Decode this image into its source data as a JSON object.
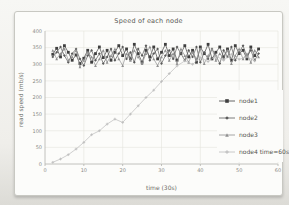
{
  "window": {
    "width": 289,
    "height": 205,
    "kind": "photographed-chart"
  },
  "colors": {
    "page_bg": "#efeeea",
    "card_bg": "#fcfcfa",
    "card_border": "#c8c8c2",
    "grid": "#e4e4de",
    "axis": "#b3b3ad",
    "text": "#5a5a55",
    "node1": "#3f3f3f",
    "node2": "#5a5a5a",
    "node3": "#909090",
    "node4": "#bcbcbc"
  },
  "chart_data": {
    "type": "line",
    "title": "Speed of each node",
    "xlabel": "time (30s)",
    "ylabel": "read speed (mb/s)",
    "xlim": [
      0,
      60
    ],
    "ylim": [
      0,
      400
    ],
    "xticks": [
      0,
      10,
      20,
      30,
      40,
      50,
      60
    ],
    "yticks": [
      0,
      50,
      100,
      150,
      200,
      250,
      300,
      350,
      400
    ],
    "grid": true,
    "legend_position": "right-inside",
    "series": [
      {
        "name": "node1",
        "color": "#3f3f3f",
        "marker": "square",
        "x": [
          2,
          3,
          4,
          5,
          6,
          7,
          8,
          9,
          10,
          11,
          12,
          13,
          14,
          15,
          16,
          17,
          18,
          19,
          20,
          21,
          22,
          23,
          24,
          25,
          26,
          27,
          28,
          29,
          30,
          31,
          32,
          33,
          34,
          35,
          36,
          37,
          38,
          39,
          40,
          41,
          42,
          43,
          44,
          45,
          46,
          47,
          48,
          49,
          50,
          51,
          52,
          53,
          54,
          55
        ],
        "y": [
          330,
          348,
          322,
          356,
          336,
          312,
          328,
          302,
          318,
          342,
          306,
          332,
          352,
          320,
          342,
          312,
          336,
          356,
          326,
          346,
          316,
          360,
          332,
          306,
          342,
          322,
          352,
          316,
          336,
          360,
          326,
          346,
          312,
          332,
          356,
          322,
          342,
          306,
          352,
          332,
          360,
          316,
          336,
          352,
          322,
          346,
          312,
          356,
          332,
          342,
          316,
          352,
          326,
          346
        ]
      },
      {
        "name": "node2",
        "color": "#5a5a5a",
        "marker": "diamond",
        "x": [
          2,
          3,
          4,
          5,
          6,
          7,
          8,
          9,
          10,
          11,
          12,
          13,
          14,
          15,
          16,
          17,
          18,
          19,
          20,
          21,
          22,
          23,
          24,
          25,
          26,
          27,
          28,
          29,
          30,
          31,
          32,
          33,
          34,
          35,
          36,
          37,
          38,
          39,
          40,
          41,
          42,
          43,
          44,
          45,
          46,
          47,
          48,
          49,
          50,
          51,
          52,
          53,
          54,
          55
        ],
        "y": [
          322,
          336,
          352,
          326,
          306,
          332,
          346,
          316,
          296,
          326,
          342,
          312,
          332,
          302,
          322,
          346,
          312,
          332,
          352,
          316,
          336,
          306,
          346,
          326,
          356,
          312,
          332,
          346,
          302,
          326,
          342,
          316,
          352,
          332,
          312,
          342,
          322,
          352,
          306,
          336,
          316,
          346,
          326,
          302,
          342,
          322,
          352,
          312,
          336,
          356,
          322,
          342,
          312,
          332
        ]
      },
      {
        "name": "node3",
        "color": "#909090",
        "marker": "triangle",
        "x": [
          2,
          3,
          4,
          5,
          6,
          7,
          8,
          9,
          10,
          11,
          12,
          13,
          14,
          15,
          16,
          17,
          18,
          19,
          20,
          21,
          22,
          23,
          24,
          25,
          26,
          27,
          28,
          29,
          30,
          31,
          32,
          33,
          34,
          35,
          36,
          37,
          38,
          39,
          40,
          41,
          42,
          43,
          44,
          45,
          46,
          47,
          48,
          49,
          50,
          51,
          52,
          53,
          54,
          55
        ],
        "y": [
          342,
          316,
          332,
          346,
          312,
          322,
          342,
          292,
          312,
          336,
          322,
          296,
          316,
          342,
          306,
          326,
          346,
          316,
          296,
          332,
          312,
          342,
          322,
          302,
          332,
          352,
          316,
          296,
          322,
          342,
          312,
          332,
          302,
          346,
          326,
          306,
          336,
          316,
          346,
          302,
          326,
          346,
          312,
          332,
          316,
          342,
          302,
          326,
          346,
          316,
          332,
          306,
          342,
          322
        ]
      },
      {
        "name": "node4 time=60s",
        "color": "#bcbcbc",
        "marker": "plus",
        "x": [
          2,
          4,
          6,
          8,
          10,
          12,
          14,
          16,
          18,
          20,
          22,
          24,
          26,
          28,
          30,
          32,
          34,
          36,
          38,
          40,
          42,
          44,
          46,
          48,
          50,
          52,
          54
        ],
        "y": [
          5,
          15,
          28,
          45,
          65,
          88,
          100,
          120,
          135,
          125,
          150,
          175,
          200,
          222,
          248,
          272,
          295,
          310,
          300,
          320,
          308,
          325,
          312,
          330,
          315,
          322,
          310
        ]
      }
    ]
  }
}
